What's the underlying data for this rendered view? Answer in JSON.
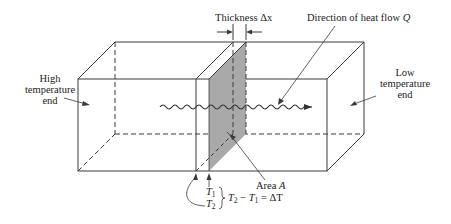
{
  "labels": {
    "thickness": "Thickness Δx",
    "heat_flow": "Direction of heat flow",
    "heat_flow_symbol": "Q",
    "high_end_line1": "High",
    "high_end_line2": "temperature",
    "high_end_line3": "end",
    "low_end_line1": "Low",
    "low_end_line2": "temperature",
    "low_end_line3": "end",
    "area": "Area",
    "area_symbol": "A",
    "t1": "T",
    "t1_sub": "1",
    "t2": "T",
    "t2_sub": "2",
    "delta_eq_a": "T",
    "delta_eq_a_sub": "2",
    "delta_eq_minus": " − ",
    "delta_eq_b": "T",
    "delta_eq_b_sub": "1",
    "delta_eq_rhs": " = ΔT"
  },
  "colors": {
    "line": "#3a3a3a",
    "slab_fill": "#a9a9a9",
    "background": "#ffffff"
  }
}
